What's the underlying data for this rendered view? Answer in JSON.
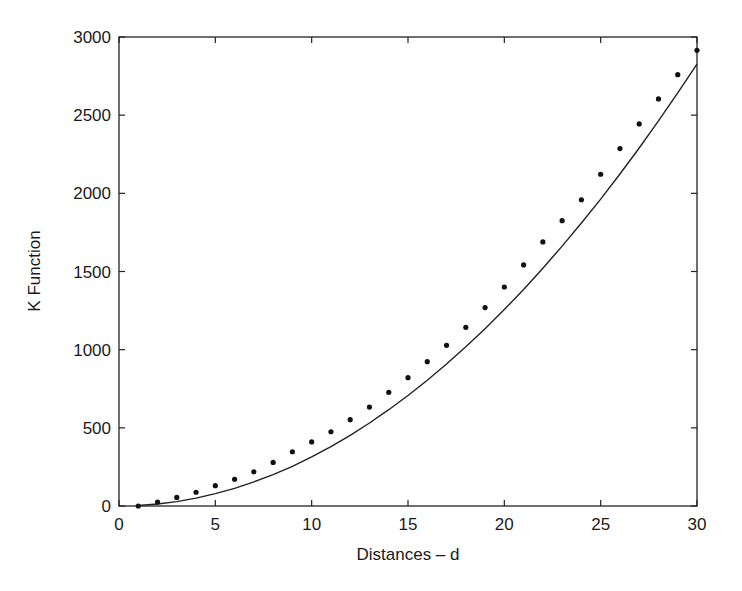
{
  "chart_data": {
    "type": "scatter",
    "title": "",
    "xlabel": "Distances – d",
    "ylabel": "K Function",
    "xlim": [
      0,
      30
    ],
    "ylim": [
      0,
      3000
    ],
    "xticks": [
      0,
      5,
      10,
      15,
      20,
      25,
      30
    ],
    "yticks": [
      0,
      500,
      1000,
      1500,
      2000,
      2500,
      3000
    ],
    "grid": false,
    "legend": null,
    "series": [
      {
        "name": "Observed K",
        "style": "dots",
        "color": "#111111",
        "x": [
          1,
          2,
          3,
          4,
          5,
          6,
          7,
          8,
          9,
          10,
          11,
          12,
          13,
          14,
          15,
          16,
          17,
          18,
          19,
          20,
          21,
          22,
          23,
          24,
          25,
          26,
          27,
          28,
          29,
          30
        ],
        "values": [
          0,
          25,
          55,
          88,
          130,
          171,
          219,
          279,
          347,
          410,
          475,
          552,
          633,
          727,
          821,
          923,
          1028,
          1143,
          1269,
          1401,
          1542,
          1689,
          1825,
          1959,
          2122,
          2286,
          2444,
          2604,
          2759,
          2915
        ]
      },
      {
        "name": "Theoretical K (πd²)",
        "style": "line",
        "color": "#111111",
        "x": [
          1,
          2,
          3,
          4,
          5,
          6,
          7,
          8,
          9,
          10,
          11,
          12,
          13,
          14,
          15,
          16,
          17,
          18,
          19,
          20,
          21,
          22,
          23,
          24,
          25,
          26,
          27,
          28,
          29,
          30
        ],
        "values": [
          3,
          13,
          28,
          50,
          79,
          113,
          154,
          201,
          254,
          314,
          380,
          452,
          531,
          616,
          707,
          804,
          908,
          1018,
          1134,
          1257,
          1385,
          1521,
          1662,
          1810,
          1963,
          2124,
          2290,
          2463,
          2642,
          2827
        ]
      }
    ]
  }
}
